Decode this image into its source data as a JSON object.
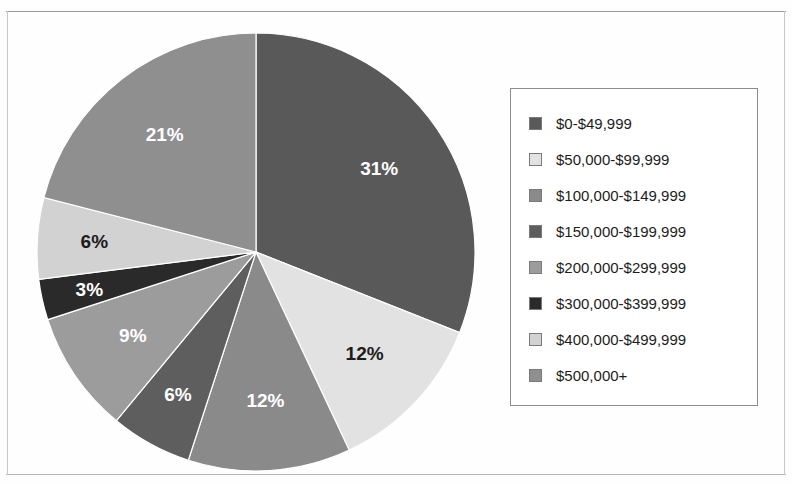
{
  "chart_data": {
    "type": "pie",
    "title": "",
    "legend_position": "right",
    "start_angle_deg": 0,
    "direction": "clockwise",
    "categories": [
      "$0-$49,999",
      "$50,000-$99,999",
      "$100,000-$149,999",
      "$150,000-$199,999",
      "$200,000-$299,999",
      "$300,000-$399,999",
      "$400,000-$499,999",
      "$500,000+"
    ],
    "values": [
      31,
      12,
      12,
      6,
      9,
      3,
      6,
      21
    ],
    "value_labels": [
      "31%",
      "12%",
      "12%",
      "6%",
      "9%",
      "3%",
      "6%",
      "21%"
    ],
    "colors": [
      "#595959",
      "#e2e2e2",
      "#8a8a8a",
      "#5e5e5e",
      "#9c9c9c",
      "#2a2a2a",
      "#d2d2d2",
      "#8f8f8f"
    ],
    "label_text_colors": [
      "#ffffff",
      "#1c1c1c",
      "#ffffff",
      "#ffffff",
      "#ffffff",
      "#ffffff",
      "#1c1c1c",
      "#ffffff"
    ]
  },
  "legend": {
    "items": [
      {
        "label": "$0-$49,999",
        "color": "#595959"
      },
      {
        "label": "$50,000-$99,999",
        "color": "#e2e2e2"
      },
      {
        "label": "$100,000-$149,999",
        "color": "#8a8a8a"
      },
      {
        "label": "$150,000-$199,999",
        "color": "#5e5e5e"
      },
      {
        "label": "$200,000-$299,999",
        "color": "#9c9c9c"
      },
      {
        "label": "$300,000-$399,999",
        "color": "#2a2a2a"
      },
      {
        "label": "$400,000-$499,999",
        "color": "#d2d2d2"
      },
      {
        "label": "$500,000+",
        "color": "#8f8f8f"
      }
    ]
  },
  "pie_geometry": {
    "cx": 220,
    "cy": 220,
    "r": 219,
    "label_radius_factor": 0.68
  }
}
